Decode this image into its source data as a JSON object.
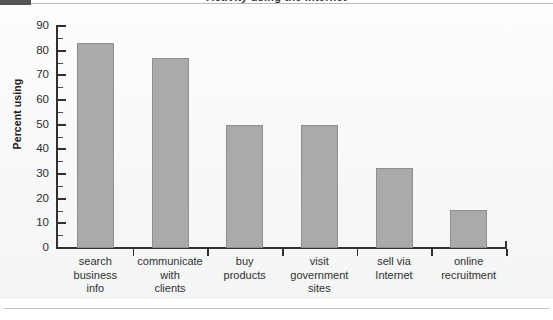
{
  "figure": {
    "corner_block_color": "#555557",
    "panel_background": "#f7f8f8",
    "title_partial": "Activity using the Internet",
    "bottom_rule_color": "#c2c4c6"
  },
  "axis": {
    "y_title": "Percent using",
    "y_ticks": [
      "90",
      "80",
      "70",
      "60",
      "50",
      "40",
      "30",
      "20",
      "10",
      "0"
    ],
    "y_min": 0,
    "y_max": 90,
    "y_major_step": 10,
    "y_minor_step": 5,
    "axis_color": "#2f3032"
  },
  "categories": [
    {
      "lines": [
        "search",
        "business",
        "info"
      ]
    },
    {
      "lines": [
        "communicate",
        "with",
        "clients"
      ]
    },
    {
      "lines": [
        "buy",
        "products"
      ]
    },
    {
      "lines": [
        "visit",
        "government",
        "sites"
      ]
    },
    {
      "lines": [
        "sell via",
        "Internet"
      ]
    },
    {
      "lines": [
        "online",
        "recruitment"
      ]
    }
  ],
  "chart_data": {
    "type": "bar",
    "title": "Activity using the Internet",
    "xlabel": "",
    "ylabel": "Percent using",
    "ylim": [
      0,
      90
    ],
    "ytick_step": 10,
    "grid": false,
    "legend": false,
    "bar_color": "#a9aaab",
    "bar_edge_color": "#8d8e8f",
    "categories": [
      "search business info",
      "communicate with clients",
      "buy products",
      "visit government sites",
      "sell via Internet",
      "online recruitment"
    ],
    "values": [
      83,
      77,
      50,
      50,
      32.5,
      15.5
    ],
    "units": "percent"
  }
}
